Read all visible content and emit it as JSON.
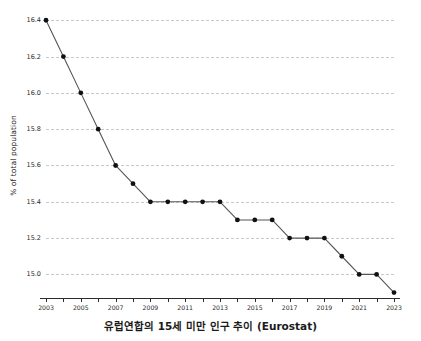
{
  "caption": "유럽연합의 15세 미만 인구 추이 (Eurostat)",
  "axis": {
    "ylabel": "% of total population"
  },
  "style": {
    "line_color": "#555555",
    "marker_color": "#111111",
    "grid_color": "#c9c9c9",
    "axis_color": "#2b2b2b",
    "background": "#ffffff"
  },
  "chart_data": {
    "type": "line",
    "title": "유럽연합의 15세 미만 인구 추이 (Eurostat)",
    "xlabel": "",
    "ylabel": "% of total population",
    "x": [
      2003,
      2004,
      2005,
      2006,
      2007,
      2008,
      2009,
      2010,
      2011,
      2012,
      2013,
      2014,
      2015,
      2016,
      2017,
      2018,
      2019,
      2020,
      2021,
      2022,
      2023
    ],
    "values": [
      16.4,
      16.2,
      16.0,
      15.8,
      15.6,
      15.5,
      15.4,
      15.4,
      15.4,
      15.4,
      15.4,
      15.3,
      15.3,
      15.3,
      15.2,
      15.2,
      15.2,
      15.1,
      15.0,
      15.0,
      14.9
    ],
    "xlim": [
      2003,
      2023
    ],
    "ylim": [
      14.87,
      16.44
    ],
    "yticks": [
      16.4,
      16.2,
      16.0,
      15.8,
      15.6,
      15.4,
      15.2,
      15.0
    ],
    "ytick_labels": [
      "16.4",
      "16.2",
      "16.0",
      "15.8",
      "15.6",
      "15.4",
      "15.2",
      "15.0"
    ],
    "xticks": [
      2003,
      2004,
      2005,
      2006,
      2007,
      2008,
      2009,
      2010,
      2011,
      2012,
      2013,
      2014,
      2015,
      2016,
      2017,
      2018,
      2019,
      2020,
      2021,
      2022,
      2023
    ],
    "xtick_labels": [
      "2003",
      "",
      "2005",
      "",
      "2007",
      "",
      "2009",
      "",
      "2011",
      "",
      "2013",
      "",
      "2015",
      "",
      "2017",
      "",
      "2019",
      "",
      "2021",
      "",
      "2023"
    ],
    "grid": true,
    "grid_axis": "y",
    "legend": false,
    "markers": true
  }
}
